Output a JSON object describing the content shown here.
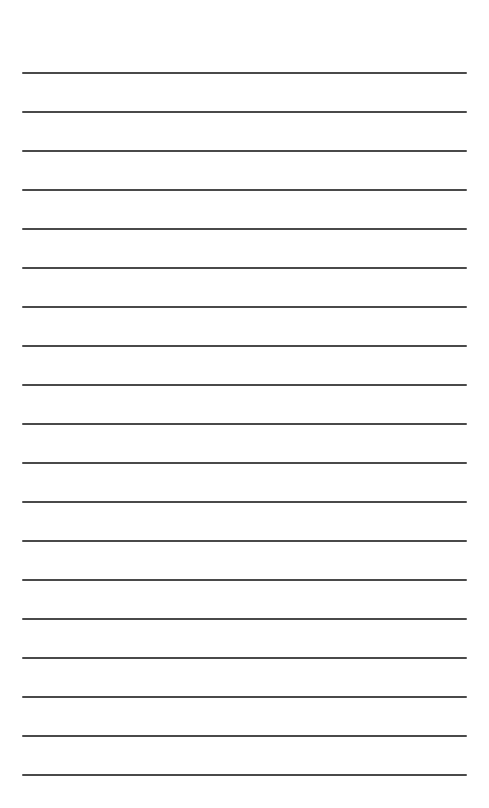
{
  "page": {
    "type": "lined-paper",
    "background_color": "#ffffff",
    "line_color": "#4a4a4a",
    "line_count": 19,
    "line_left": 22,
    "line_width": 445,
    "line_thickness": 2,
    "first_line_y": 72,
    "line_spacing": 39
  },
  "lines": [
    {
      "y": 72
    },
    {
      "y": 111
    },
    {
      "y": 150
    },
    {
      "y": 189
    },
    {
      "y": 228
    },
    {
      "y": 267
    },
    {
      "y": 306
    },
    {
      "y": 345
    },
    {
      "y": 384
    },
    {
      "y": 423
    },
    {
      "y": 462
    },
    {
      "y": 501
    },
    {
      "y": 540
    },
    {
      "y": 579
    },
    {
      "y": 618
    },
    {
      "y": 657
    },
    {
      "y": 696
    },
    {
      "y": 735
    },
    {
      "y": 774
    }
  ]
}
